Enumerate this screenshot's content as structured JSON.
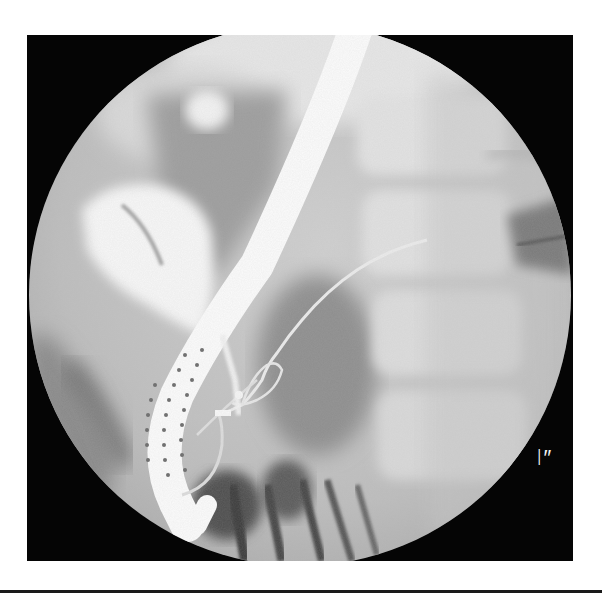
{
  "image": {
    "type": "fluoroscopy",
    "view": "circular field of view inside black square frame",
    "description": "X-ray image showing a duodenoscope curving through the upper abdomen with a catheter/guidewire extending up into the biliary tree, spine visible on the right",
    "colors": {
      "background": "#ffffff",
      "frame": "#050505",
      "soft_tissue": "#b9b9b9",
      "bone": "#dedede",
      "scope": "#fafafa",
      "bowel_gas": "#555555"
    }
  },
  "overlay": {
    "marker_label": "I″"
  }
}
